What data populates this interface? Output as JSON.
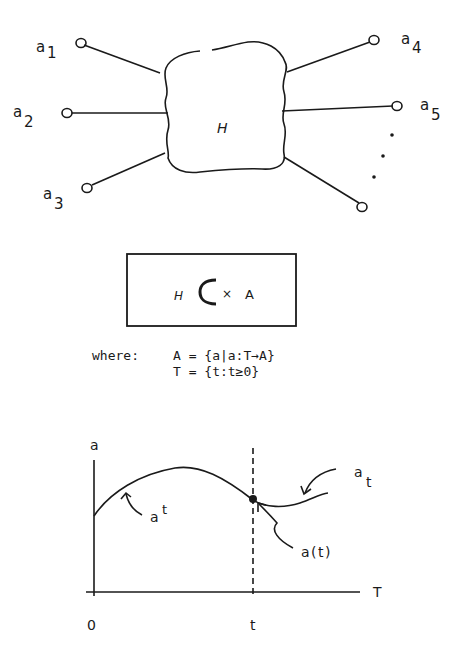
{
  "top_diagram": {
    "center_label": "H",
    "terminals": [
      {
        "base": "a",
        "sub": "1"
      },
      {
        "base": "a",
        "sub": "2"
      },
      {
        "base": "a",
        "sub": "3"
      },
      {
        "base": "a",
        "sub": "4"
      },
      {
        "base": "a",
        "sub": "5"
      }
    ],
    "continuation": "..."
  },
  "relation_box": {
    "left": "H",
    "subset_symbol": "⊂",
    "times": "×",
    "right": "A"
  },
  "definitions": {
    "keyword": "where:",
    "lines": [
      "A = {a|a:T→A}",
      "T = {t:t≥0}"
    ]
  },
  "graph": {
    "y_axis_label": "a",
    "x_axis_label": "T",
    "x_ticks": [
      "0",
      "t"
    ],
    "past_label_base": "a",
    "past_label_sup": "t",
    "future_label_base": "a",
    "future_label_sub": "t",
    "point_label": "a(t)"
  }
}
